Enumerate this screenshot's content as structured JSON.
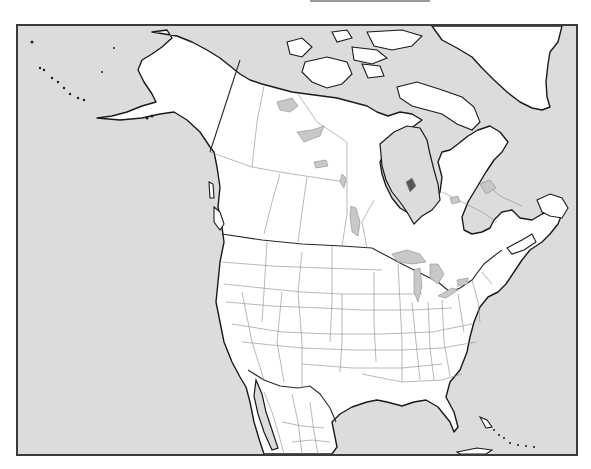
{
  "map": {
    "title": "",
    "type": "blank outline map",
    "region": "North America",
    "countries": [
      "Canada",
      "United States",
      "Mexico",
      "Greenland"
    ],
    "features": {
      "water_bodies": [
        "Pacific Ocean",
        "Atlantic Ocean",
        "Gulf of Mexico",
        "Hudson Bay",
        "Arctic Ocean"
      ],
      "lakes": [
        "Great Lakes",
        "Great Bear Lake",
        "Great Slave Lake",
        "Lake Winnipeg",
        "Lake Athabasca"
      ],
      "boundaries": [
        "international",
        "state/province"
      ]
    },
    "labels_visible": false,
    "colors": {
      "water": "#dcdcdc",
      "land": "#ffffff",
      "coastline": "#1a1a1a",
      "internal_border": "#8a8a8a",
      "lake": "#c8c8c8",
      "frame": "#3a3a3a"
    }
  }
}
